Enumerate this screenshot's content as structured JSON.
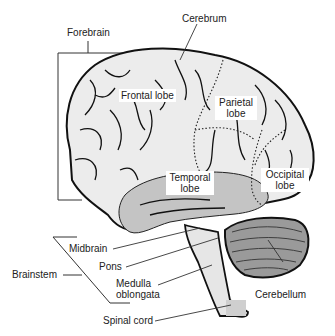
{
  "diagram": {
    "colors": {
      "background": "#ffffff",
      "cerebrum_fill": "#ececec",
      "temporal_fill": "#c4c4c4",
      "cerebellum_fill": "#9a9a9a",
      "brainstem_fill": "#e6e6e6",
      "outline": "#111111",
      "leader_line": "#333333"
    },
    "labels": {
      "forebrain": "Forebrain",
      "cerebrum": "Cerebrum",
      "frontal_lobe": "Frontal lobe",
      "parietal_lobe_1": "Parietal",
      "parietal_lobe_2": "lobe",
      "temporal_lobe_1": "Temporal",
      "temporal_lobe_2": "lobe",
      "occipital_lobe_1": "Occipital",
      "occipital_lobe_2": "lobe",
      "midbrain": "Midbrain",
      "pons": "Pons",
      "brainstem": "Brainstem",
      "medulla_1": "Medulla",
      "medulla_2": "oblongata",
      "spinal_cord": "Spinal cord",
      "cerebellum": "Cerebellum"
    }
  }
}
